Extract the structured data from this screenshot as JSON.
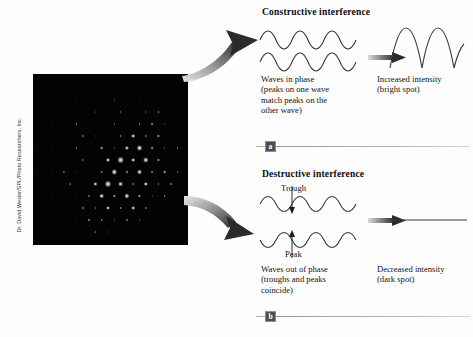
{
  "figure": {
    "credit": "Dr. David Wexler/SPL/Photo Researchers, Inc.",
    "photo_alt": "x-ray-diffraction-pattern"
  },
  "panels": [
    {
      "id": "constructive",
      "heading": "Constructive interference",
      "badge": "a",
      "input_caption": "Waves in phase\n(peaks on one wave\nmatch peaks on the\nother wave)",
      "input_caption_lines": [
        "Waves in phase",
        "(peaks on one wave",
        "match peaks on the",
        "other wave)"
      ],
      "output_caption_lines": [
        "Increased intensity",
        "(bright spot)"
      ],
      "wave_labels": []
    },
    {
      "id": "destructive",
      "heading": "Destructive interference",
      "badge": "b",
      "input_caption_lines": [
        "Waves out of phase",
        "(troughs and peaks",
        "coincide)"
      ],
      "output_caption_lines": [
        "Decreased intensity",
        "(dark spot)"
      ],
      "wave_labels": [
        {
          "text": "Trough",
          "target": "upper-wave"
        },
        {
          "text": "Peak",
          "target": "lower-wave"
        }
      ]
    }
  ],
  "arrows": {
    "top_arrow_name": "curved-arrow-to-constructive",
    "bottom_arrow_name": "curved-arrow-to-destructive",
    "inline_arrow_name": "gradient-right-arrow"
  },
  "colors": {
    "background": "#fdfdfd",
    "photo_background": "#030303",
    "spot_highlight": "#e8e8e8",
    "text": "#141414",
    "badge_fill": "#4e4e4e",
    "rule": "#b0b0b0",
    "wave_stroke": "#3a3a3a"
  }
}
